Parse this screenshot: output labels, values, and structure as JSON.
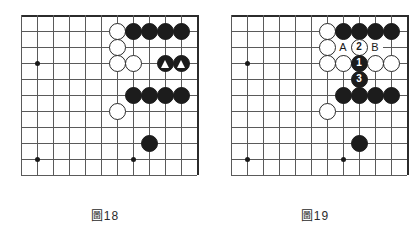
{
  "page": {
    "kind": "go-board-diagram-pair",
    "background_color": "#ffffff"
  },
  "board_geometry": {
    "columns": 12,
    "rows": 11,
    "cell_size": 16,
    "origin_x": 7,
    "origin_y": 2,
    "line_color": "#5a5a5a",
    "edge_color": "#2b2b2b",
    "black_color": "#1c1c1c",
    "white_color": "#ffffff"
  },
  "figures": [
    {
      "id": "figure-18",
      "caption": "圖18",
      "star_points": [
        {
          "col": 1,
          "row": 3
        },
        {
          "col": 7,
          "row": 3
        },
        {
          "col": 1,
          "row": 9
        },
        {
          "col": 7,
          "row": 9
        }
      ],
      "stones": [
        {
          "col": 6,
          "row": 1,
          "color": "white"
        },
        {
          "col": 7,
          "row": 1,
          "color": "black"
        },
        {
          "col": 8,
          "row": 1,
          "color": "black"
        },
        {
          "col": 9,
          "row": 1,
          "color": "black"
        },
        {
          "col": 10,
          "row": 1,
          "color": "black"
        },
        {
          "col": 6,
          "row": 2,
          "color": "white"
        },
        {
          "col": 6,
          "row": 3,
          "color": "white"
        },
        {
          "col": 7,
          "row": 3,
          "color": "white"
        },
        {
          "col": 9,
          "row": 3,
          "color": "black",
          "mark": "triangle"
        },
        {
          "col": 10,
          "row": 3,
          "color": "black",
          "mark": "triangle"
        },
        {
          "col": 7,
          "row": 5,
          "color": "black"
        },
        {
          "col": 8,
          "row": 5,
          "color": "black"
        },
        {
          "col": 9,
          "row": 5,
          "color": "black"
        },
        {
          "col": 10,
          "row": 5,
          "color": "black"
        },
        {
          "col": 6,
          "row": 6,
          "color": "white"
        },
        {
          "col": 8,
          "row": 8,
          "color": "black"
        }
      ],
      "point_labels": []
    },
    {
      "id": "figure-19",
      "caption": "圖19",
      "star_points": [
        {
          "col": 1,
          "row": 3
        },
        {
          "col": 7,
          "row": 3
        },
        {
          "col": 1,
          "row": 9
        },
        {
          "col": 7,
          "row": 9
        }
      ],
      "stones": [
        {
          "col": 6,
          "row": 1,
          "color": "white"
        },
        {
          "col": 7,
          "row": 1,
          "color": "black"
        },
        {
          "col": 8,
          "row": 1,
          "color": "black"
        },
        {
          "col": 9,
          "row": 1,
          "color": "black"
        },
        {
          "col": 10,
          "row": 1,
          "color": "black"
        },
        {
          "col": 6,
          "row": 2,
          "color": "white"
        },
        {
          "col": 8,
          "row": 2,
          "color": "white",
          "number": "2"
        },
        {
          "col": 6,
          "row": 3,
          "color": "white"
        },
        {
          "col": 7,
          "row": 3,
          "color": "white"
        },
        {
          "col": 8,
          "row": 3,
          "color": "black",
          "number": "1"
        },
        {
          "col": 9,
          "row": 3,
          "color": "white"
        },
        {
          "col": 10,
          "row": 3,
          "color": "white"
        },
        {
          "col": 8,
          "row": 4,
          "color": "black",
          "number": "3"
        },
        {
          "col": 7,
          "row": 5,
          "color": "black"
        },
        {
          "col": 8,
          "row": 5,
          "color": "black"
        },
        {
          "col": 9,
          "row": 5,
          "color": "black"
        },
        {
          "col": 10,
          "row": 5,
          "color": "black"
        },
        {
          "col": 6,
          "row": 6,
          "color": "white"
        },
        {
          "col": 8,
          "row": 8,
          "color": "black"
        }
      ],
      "point_labels": [
        {
          "col": 7,
          "row": 2,
          "text": "A"
        },
        {
          "col": 9,
          "row": 2,
          "text": "B"
        }
      ]
    }
  ]
}
